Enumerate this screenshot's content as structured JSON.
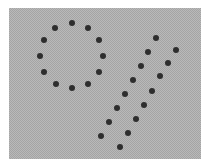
{
  "figure": {
    "background_color": "#b9b9b9",
    "dot_color": "#2e2e2e",
    "groups": [
      {
        "name": "circle",
        "points": [
          [
            72,
            23
          ],
          [
            88,
            28
          ],
          [
            99,
            40
          ],
          [
            103,
            56
          ],
          [
            99,
            72
          ],
          [
            88,
            84
          ],
          [
            72,
            88
          ],
          [
            56,
            84
          ],
          [
            44,
            72
          ],
          [
            40,
            56
          ],
          [
            44,
            40
          ],
          [
            55,
            28
          ]
        ]
      },
      {
        "name": "v-left-arm",
        "points": [
          [
            156,
            38
          ],
          [
            148,
            52
          ],
          [
            141,
            66
          ],
          [
            133,
            80
          ],
          [
            125,
            94
          ],
          [
            117,
            108
          ],
          [
            109,
            122
          ],
          [
            101,
            136
          ]
        ]
      },
      {
        "name": "v-right-arm",
        "points": [
          [
            176,
            50
          ],
          [
            168,
            63
          ],
          [
            160,
            76
          ],
          [
            152,
            91
          ],
          [
            144,
            105
          ],
          [
            136,
            119
          ],
          [
            128,
            133
          ]
        ]
      },
      {
        "name": "v-bottom",
        "points": [
          [
            120,
            147
          ]
        ]
      }
    ]
  }
}
